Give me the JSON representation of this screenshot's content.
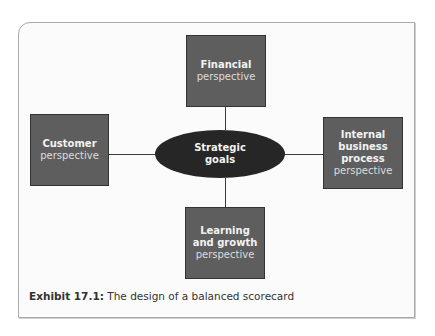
{
  "diagram": {
    "center": {
      "line1": "Strategic",
      "line2": "goals"
    },
    "nodes": {
      "top": {
        "title": "Financial",
        "sub": "perspective"
      },
      "left": {
        "title": "Customer",
        "sub": "perspective"
      },
      "right": {
        "title1": "Internal",
        "title2": "business",
        "title3": "process",
        "sub": "perspective"
      },
      "bottom": {
        "title1": "Learning",
        "title2": "and growth",
        "sub": "perspective"
      }
    }
  },
  "caption": {
    "label": "Exhibit 17.1:",
    "text": "The design of a balanced scorecard"
  },
  "colors": {
    "box": "#5e5e5e",
    "ellipse": "#262626",
    "frame_border": "#a9a9a9"
  }
}
